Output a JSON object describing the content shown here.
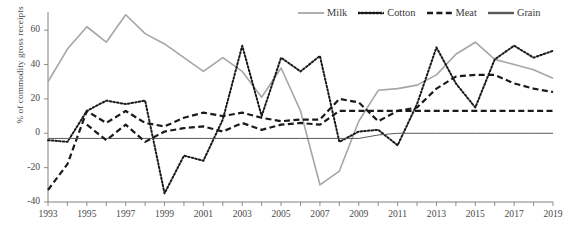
{
  "chart_data": {
    "type": "line",
    "title": "",
    "xlabel": "",
    "ylabel": "% of commodity gross receipts",
    "xlim": [
      1993,
      2019
    ],
    "ylim": [
      -40,
      70
    ],
    "yticks": [
      60,
      40,
      20,
      0,
      -20,
      -40
    ],
    "ytick_labels": [
      "60",
      "40",
      "20",
      "0",
      "-20",
      "-40"
    ],
    "xticks": [
      1993,
      1995,
      1997,
      1999,
      2001,
      2003,
      2005,
      2007,
      2009,
      2011,
      2013,
      2015,
      2017,
      2019
    ],
    "xtick_labels": [
      "1993",
      "1995",
      "1997",
      "1999",
      "2001",
      "2003",
      "2005",
      "2007",
      "2009",
      "2011",
      "2013",
      "2015",
      "2017",
      "2019"
    ],
    "x": [
      1993,
      1994,
      1995,
      1996,
      1997,
      1998,
      1999,
      2000,
      2001,
      2002,
      2003,
      2004,
      2005,
      2006,
      2007,
      2008,
      2009,
      2010,
      2011,
      2012,
      2013,
      2014,
      2015,
      2016,
      2017,
      2018,
      2019
    ],
    "grid": false,
    "legend_position": "top-right",
    "series": [
      {
        "name": "Milk",
        "color": "#a6a6a6",
        "style": "solid",
        "values": [
          30,
          49,
          62,
          53,
          69,
          58,
          52,
          44,
          36,
          44,
          36,
          21,
          38,
          13,
          -30,
          -22,
          7,
          25,
          26,
          28,
          34,
          46,
          53,
          43,
          40,
          37,
          32
        ]
      },
      {
        "name": "Cotton",
        "color": "#1a1a1a",
        "style": "dotted",
        "values": [
          -4,
          -5,
          13,
          19,
          17,
          19,
          -35,
          -13,
          -16,
          8,
          51,
          10,
          44,
          36,
          45,
          -5,
          1,
          2,
          -7,
          17,
          50,
          29,
          15,
          43,
          51,
          44,
          48
        ]
      },
      {
        "name": "Meat",
        "color": "#1a1a1a",
        "style": "dashed",
        "values": [
          -33,
          -18,
          13,
          6,
          13,
          6,
          4,
          9,
          12,
          10,
          12,
          9,
          7,
          8,
          8,
          20,
          18,
          7,
          13,
          15,
          26,
          33,
          34,
          34,
          29,
          26,
          24
        ]
      },
      {
        "name": "Grain",
        "color": "#595959",
        "style": "solid-thin",
        "values": [
          -3,
          -3,
          -3,
          -3,
          -3,
          -3,
          -3,
          -3,
          -3,
          -3,
          -3,
          -3,
          -3,
          -3,
          -3,
          -3,
          -3,
          -1,
          0,
          0,
          0,
          0,
          0,
          0,
          0,
          0,
          0
        ]
      }
    ],
    "secondary_series": [
      {
        "name": "Meat-low",
        "note": "lower dashed segment tracking near zero 1995-2011",
        "values": [
          null,
          null,
          5,
          -4,
          5,
          -5,
          1,
          3,
          4,
          1,
          6,
          2,
          5,
          6,
          5,
          13,
          13,
          13,
          13,
          13,
          13,
          13,
          13,
          13,
          13,
          13,
          13
        ]
      }
    ]
  },
  "legend": {
    "items": [
      {
        "label": "Milk",
        "icon": "line-solid-gray-icon"
      },
      {
        "label": "Cotton",
        "icon": "line-dotted-icon"
      },
      {
        "label": "Meat",
        "icon": "line-dashed-icon"
      },
      {
        "label": "Grain",
        "icon": "line-solid-black-icon"
      }
    ]
  },
  "axis": {
    "y_title": "% of commodity gross receipts"
  }
}
